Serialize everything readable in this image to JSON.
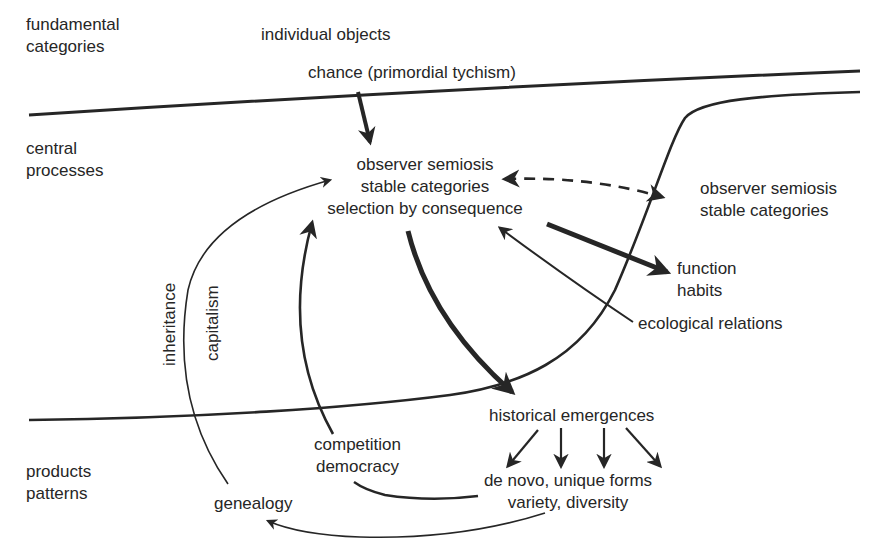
{
  "diagram": {
    "levels": {
      "fundamental": [
        "fundamental",
        "categories"
      ],
      "central": [
        "central",
        "processes"
      ],
      "products": [
        "products",
        "patterns"
      ]
    },
    "nodes": {
      "individual_objects": "individual objects",
      "chance": "chance (primordial tychism)",
      "center": [
        "observer semiosis",
        "stable categories",
        "selection by consequence"
      ],
      "right_observer": [
        "observer semiosis",
        "stable categories"
      ],
      "function": [
        "function",
        "habits"
      ],
      "ecological": "ecological relations",
      "historical": "historical emergences",
      "forms": [
        "de novo, unique forms",
        "variety, diversity"
      ],
      "competition": [
        "competition",
        "democracy"
      ],
      "genealogy": "genealogy",
      "inheritance": "inheritance",
      "capitalism": "capitalism"
    },
    "edges": [
      {
        "from": "chance",
        "to": "center",
        "style": "bold"
      },
      {
        "from": "center",
        "to": "right_observer",
        "style": "dashed-bidirectional"
      },
      {
        "from": "center",
        "to": "function",
        "style": "bold"
      },
      {
        "from": "ecological",
        "to": "center",
        "style": "thin"
      },
      {
        "from": "center",
        "to": "historical",
        "style": "bold"
      },
      {
        "from": "historical",
        "to": "forms",
        "style": "four-arrows"
      },
      {
        "from": "forms",
        "to": "competition",
        "style": "thin-line"
      },
      {
        "from": "competition",
        "to": "center",
        "style": "medium",
        "label": "capitalism"
      },
      {
        "from": "forms",
        "to": "genealogy",
        "style": "thin"
      },
      {
        "from": "genealogy",
        "to": "center",
        "style": "thin",
        "label": "inheritance"
      }
    ],
    "colors": {
      "ink": "#262626",
      "background": "#ffffff"
    }
  }
}
